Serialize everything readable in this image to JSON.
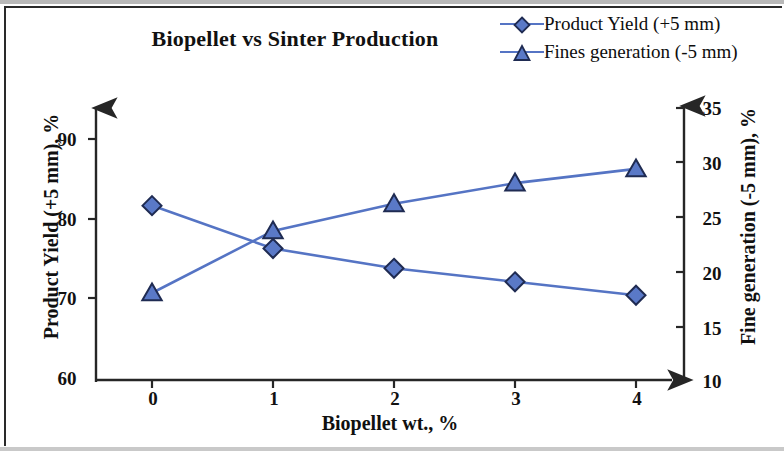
{
  "chart_data": {
    "type": "line",
    "title": "Biopellet vs Sinter Production",
    "xlabel": "Biopellet wt., %",
    "ylabel": "Product Yield (+5 mm), %",
    "y2label": "Fine generation (-5 mm), %",
    "x": [
      0,
      1,
      2,
      3,
      4
    ],
    "xticklabels": [
      "0",
      "1",
      "2",
      "3",
      "4"
    ],
    "xlim": [
      -0.42,
      4.6
    ],
    "ylim": [
      60,
      93
    ],
    "yticks": [
      60,
      70,
      80,
      90
    ],
    "yticklabels": [
      "60",
      "70",
      "80",
      "90"
    ],
    "y2lim": [
      10,
      36
    ],
    "y2ticks": [
      10,
      15,
      20,
      25,
      30,
      35
    ],
    "y2ticklabels": [
      "10",
      "15",
      "20",
      "25",
      "30",
      "35"
    ],
    "grid": false,
    "legend_position": "top-right",
    "series": [
      {
        "name": "Product Yield (+5 mm)",
        "axis": "left",
        "marker": "diamond",
        "color": "#5574c4",
        "marker_fill": "#5a79c7",
        "marker_edge": "#1f2b52",
        "values": [
          81.6,
          76.2,
          73.7,
          72.0,
          70.3
        ]
      },
      {
        "name": "Fines generation (-5 mm)",
        "axis": "right",
        "marker": "triangle",
        "color": "#5574c4",
        "marker_fill": "#5a79c7",
        "marker_edge": "#1f2b52",
        "values": [
          18.0,
          23.7,
          26.2,
          28.1,
          29.4
        ]
      }
    ]
  },
  "legend": {
    "items": [
      {
        "label": "Product Yield (+5 mm)",
        "marker": "diamond-marker"
      },
      {
        "label": "Fines generation (-5 mm)",
        "marker": "triangle-marker"
      }
    ]
  },
  "colors": {
    "series": "#5574c4",
    "marker_fill": "#5a79c7",
    "marker_edge": "#1f2b52",
    "axis": "#262626",
    "text": "#111111",
    "background": "#ffffff"
  }
}
